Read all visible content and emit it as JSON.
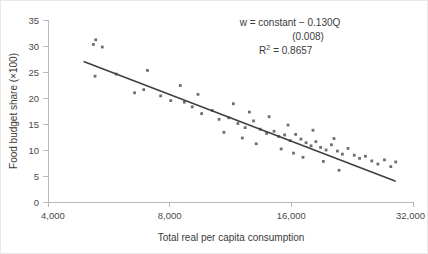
{
  "chart_data": {
    "type": "scatter",
    "title": "",
    "xlabel": "Total real per capita consumption",
    "ylabel": "Food budget share (×100)",
    "x_scale": "log2",
    "xlim": [
      4000,
      32000
    ],
    "ylim": [
      0,
      35
    ],
    "xticks": [
      4000,
      8000,
      16000,
      32000
    ],
    "xtick_labels": [
      "4,000",
      "8,000",
      "16,000",
      "32,000"
    ],
    "yticks": [
      0,
      5,
      10,
      15,
      20,
      25,
      30,
      35
    ],
    "ytick_labels": [
      "0",
      "5",
      "10",
      "15",
      "20",
      "25",
      "30",
      "35"
    ],
    "grid": false,
    "legend": null,
    "annotations": {
      "equation": "w = constant − 0.130Q",
      "std_error": "(0.008)",
      "r_squared_label": "R",
      "r_squared_exponent": "2",
      "r_squared_value": "= 0.8657"
    },
    "series": [
      {
        "name": "Food budget share observations",
        "marker": "square",
        "color": "#6f6f6f",
        "points": [
          [
            5250,
            31.2
          ],
          [
            5180,
            30.3
          ],
          [
            5450,
            29.8
          ],
          [
            5900,
            24.6
          ],
          [
            5230,
            24.2
          ],
          [
            6550,
            21.0
          ],
          [
            7050,
            25.3
          ],
          [
            8050,
            19.5
          ],
          [
            8700,
            19.2
          ],
          [
            9600,
            17.0
          ],
          [
            6900,
            21.6
          ],
          [
            7600,
            20.4
          ],
          [
            9100,
            18.3
          ],
          [
            10200,
            17.6
          ],
          [
            10600,
            15.9
          ],
          [
            8500,
            22.4
          ],
          [
            9400,
            20.7
          ],
          [
            11200,
            16.2
          ],
          [
            11800,
            15.1
          ],
          [
            12300,
            14.3
          ],
          [
            10900,
            13.4
          ],
          [
            12900,
            15.6
          ],
          [
            13400,
            14.0
          ],
          [
            13900,
            13.2
          ],
          [
            12100,
            12.3
          ],
          [
            14500,
            13.6
          ],
          [
            14900,
            12.6
          ],
          [
            15400,
            12.9
          ],
          [
            15900,
            11.8
          ],
          [
            13100,
            11.2
          ],
          [
            16400,
            13.0
          ],
          [
            16900,
            12.1
          ],
          [
            17400,
            11.4
          ],
          [
            17900,
            10.8
          ],
          [
            15100,
            10.2
          ],
          [
            18400,
            11.6
          ],
          [
            18900,
            10.5
          ],
          [
            19500,
            10.0
          ],
          [
            16200,
            9.4
          ],
          [
            20100,
            11.0
          ],
          [
            20800,
            9.8
          ],
          [
            21400,
            9.2
          ],
          [
            17100,
            8.6
          ],
          [
            22100,
            10.3
          ],
          [
            22900,
            9.0
          ],
          [
            23600,
            8.4
          ],
          [
            19200,
            7.8
          ],
          [
            24400,
            8.8
          ],
          [
            25300,
            7.9
          ],
          [
            26200,
            7.3
          ],
          [
            21000,
            6.1
          ],
          [
            27200,
            8.1
          ],
          [
            28200,
            6.8
          ],
          [
            29000,
            7.7
          ],
          [
            11500,
            18.9
          ],
          [
            12600,
            17.3
          ],
          [
            14100,
            16.4
          ],
          [
            15700,
            14.8
          ],
          [
            18100,
            13.8
          ],
          [
            20400,
            12.2
          ]
        ]
      }
    ],
    "fit_line": {
      "name": "OLS regression line",
      "color": "#404040",
      "x_start": 4900,
      "y_start": 27.0,
      "x_end": 29000,
      "y_end": 4.0
    }
  }
}
